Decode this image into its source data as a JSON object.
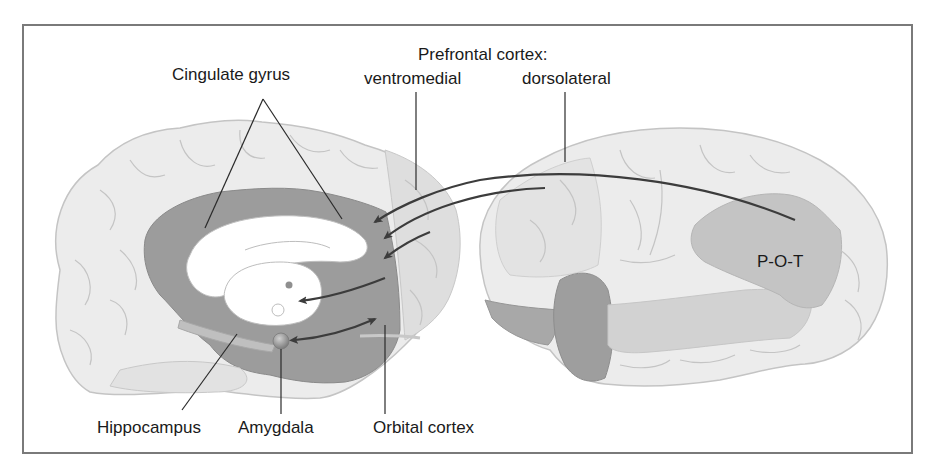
{
  "figure": {
    "labels": {
      "cingulate_gyrus": "Cingulate gyrus",
      "prefrontal_cortex": "Prefrontal cortex:",
      "ventromedial": "ventromedial",
      "dorsolateral": "dorsolateral",
      "pot": "P-O-T",
      "hippocampus": "Hippocampus",
      "amygdala": "Amygdala",
      "orbital_cortex": "Orbital cortex"
    },
    "views": [
      {
        "name": "medial-view",
        "description": "Medial (sagittal) view of left hemisphere"
      },
      {
        "name": "lateral-view",
        "description": "Lateral view of hemisphere"
      }
    ],
    "colors": {
      "frame": "#7a7a7a",
      "cortex_light": "#ececec",
      "sulcus": "#bdbdbd",
      "limbic_dark": "#9c9c9c",
      "prefrontal_mid": "#dcdcdc",
      "pot_region": "#c4c4c4",
      "temporal_pole": "#9e9e9e",
      "arrow": "#3c3c3c",
      "white_matter": "#ffffff"
    }
  }
}
